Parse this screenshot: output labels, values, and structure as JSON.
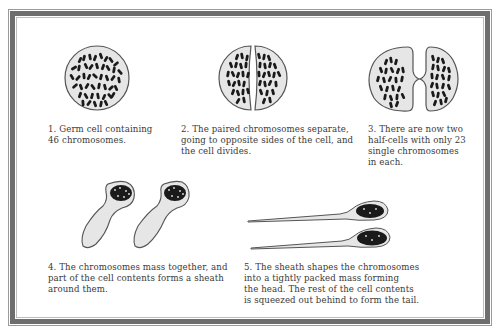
{
  "diagram": {
    "steps": [
      {
        "number": "1",
        "caption": "1. Germ cell containing\n46 chromosomes."
      },
      {
        "number": "2",
        "caption": "2. The paired chromosomes separate,\ngoing to opposite sides of the cell, and\nthe cell divides."
      },
      {
        "number": "3",
        "caption": "3. There are now two\nhalf-cells with only 23\nsingle chromosomes\nin each."
      },
      {
        "number": "4",
        "caption": "4. The chromosomes mass together, and\npart of the cell contents forms a sheath\naround them."
      },
      {
        "number": "5",
        "caption": "5. The sheath shapes the chromosomes\ninto a tightly packed mass forming\nthe head. The rest of the cell contents\nis squeezed out behind to form the tail."
      }
    ],
    "colors": {
      "frame": "#6e6e6e",
      "cell_fill": "#e6e6e6",
      "cell_outline": "#555555",
      "chromosome": "#1a1a1a",
      "text": "#3a3a3a"
    }
  }
}
